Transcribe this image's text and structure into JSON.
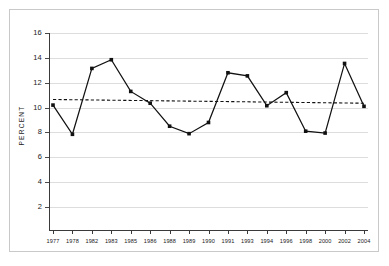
{
  "figure": {
    "border_color": "#c9c9c9",
    "background": "#ffffff"
  },
  "chart_data": {
    "type": "line",
    "title": "",
    "xlabel": "",
    "ylabel": "PERCENT",
    "categories": [
      "1977",
      "1978",
      "1982",
      "1983",
      "1985",
      "1986",
      "1988",
      "1989",
      "1990",
      "1991",
      "1993",
      "1994",
      "1996",
      "1998",
      "2000",
      "2002",
      "2004"
    ],
    "values": [
      10.2,
      7.85,
      13.15,
      13.85,
      11.3,
      10.35,
      8.5,
      7.9,
      8.8,
      12.8,
      12.55,
      10.15,
      11.2,
      8.1,
      7.95,
      13.55,
      10.1
    ],
    "series": [
      {
        "name": "percent",
        "style": "solid-line-with-square-markers",
        "color": "#111111",
        "values": [
          10.2,
          7.85,
          13.15,
          13.85,
          11.3,
          10.35,
          8.5,
          7.9,
          8.8,
          12.8,
          12.55,
          10.15,
          11.2,
          8.1,
          7.95,
          13.55,
          10.1
        ]
      },
      {
        "name": "trend",
        "style": "dashed-line",
        "color": "#111111",
        "endpoints": [
          10.65,
          10.35
        ]
      }
    ],
    "ylim": [
      0,
      16
    ],
    "yticks": [
      2,
      4,
      6,
      8,
      10,
      12,
      14,
      16
    ],
    "ytick_labels": [
      "2",
      "4",
      "6",
      "8",
      "10",
      "12",
      "14",
      "16"
    ],
    "grid": true,
    "grid_color": "#dddddd",
    "legend": "none"
  }
}
